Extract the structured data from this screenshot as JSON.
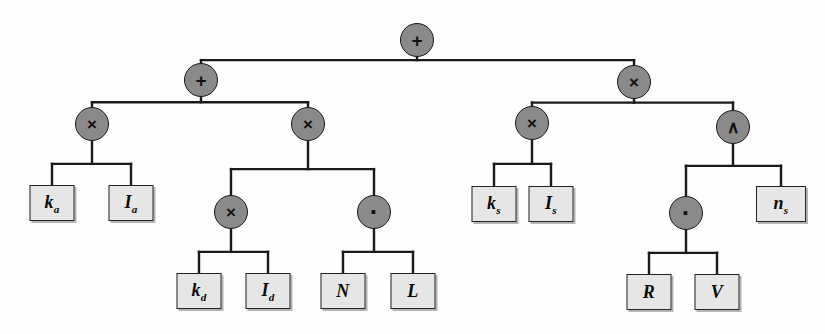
{
  "diagram": {
    "type": "binary-expression-tree",
    "background_color": "#fdfdfd",
    "node_fill": "#8a8a8a",
    "leaf_fill": "#e6e6e6",
    "edge_color": "#1a1a1a",
    "expression": "ka × Ia + kd × Id · (N · L) + ks × Is × (R · V) ^ ns"
  },
  "operators": [
    {
      "id": "root",
      "glyph": "+",
      "name": "plus",
      "x": 417,
      "y": 40,
      "r": 17,
      "font_size": 19
    },
    {
      "id": "op-left",
      "glyph": "+",
      "name": "plus",
      "x": 201,
      "y": 80,
      "r": 17,
      "font_size": 19
    },
    {
      "id": "op-ka",
      "glyph": "×",
      "name": "times",
      "x": 92,
      "y": 124,
      "r": 17,
      "font_size": 17
    },
    {
      "id": "op-diff",
      "glyph": "×",
      "name": "times",
      "x": 308,
      "y": 124,
      "r": 17,
      "font_size": 17
    },
    {
      "id": "op-kd",
      "glyph": "×",
      "name": "times",
      "x": 231,
      "y": 212,
      "r": 17,
      "font_size": 17
    },
    {
      "id": "op-dot-nl",
      "glyph": "·",
      "name": "dot-product",
      "x": 374,
      "y": 212,
      "r": 17,
      "font_size": 26
    },
    {
      "id": "op-right",
      "glyph": "×",
      "name": "times",
      "x": 634,
      "y": 82,
      "r": 17,
      "font_size": 17
    },
    {
      "id": "op-ks",
      "glyph": "×",
      "name": "times",
      "x": 532,
      "y": 123,
      "r": 17,
      "font_size": 17
    },
    {
      "id": "op-pow",
      "glyph": "∧",
      "name": "power",
      "x": 733,
      "y": 127,
      "r": 17,
      "font_size": 17
    },
    {
      "id": "op-dot-rv",
      "glyph": "·",
      "name": "dot-product",
      "x": 686,
      "y": 213,
      "r": 17,
      "font_size": 26
    }
  ],
  "leaves": [
    {
      "id": "leaf-ka",
      "base": "k",
      "sub": "a",
      "x": 52,
      "y": 203,
      "w": 45,
      "h": 36
    },
    {
      "id": "leaf-Ia",
      "base": "I",
      "sub": "a",
      "x": 131,
      "y": 203,
      "w": 45,
      "h": 36
    },
    {
      "id": "leaf-kd",
      "base": "k",
      "sub": "d",
      "x": 199,
      "y": 291,
      "w": 45,
      "h": 36
    },
    {
      "id": "leaf-Id",
      "base": "I",
      "sub": "d",
      "x": 268,
      "y": 291,
      "w": 45,
      "h": 36
    },
    {
      "id": "leaf-N",
      "base": "N",
      "sub": "",
      "x": 343,
      "y": 291,
      "w": 45,
      "h": 36
    },
    {
      "id": "leaf-L",
      "base": "L",
      "sub": "",
      "x": 413,
      "y": 291,
      "w": 45,
      "h": 36
    },
    {
      "id": "leaf-ks",
      "base": "k",
      "sub": "s",
      "x": 494,
      "y": 204,
      "w": 45,
      "h": 36
    },
    {
      "id": "leaf-Is",
      "base": "I",
      "sub": "s",
      "x": 551,
      "y": 204,
      "w": 45,
      "h": 36
    },
    {
      "id": "leaf-ns",
      "base": "n",
      "sub": "s",
      "x": 781,
      "y": 204,
      "w": 50,
      "h": 36
    },
    {
      "id": "leaf-R",
      "base": "R",
      "sub": "",
      "x": 649,
      "y": 292,
      "w": 45,
      "h": 36
    },
    {
      "id": "leaf-V",
      "base": "V",
      "sub": "",
      "x": 717,
      "y": 292,
      "w": 45,
      "h": 36
    }
  ],
  "edges": [
    {
      "from": "root",
      "to": "op-left",
      "name": "edge-root-to-left-plus"
    },
    {
      "from": "root",
      "to": "op-right",
      "name": "edge-root-to-right-times"
    },
    {
      "from": "op-left",
      "to": "op-ka",
      "name": "edge-leftplus-to-ambient-times"
    },
    {
      "from": "op-left",
      "to": "op-diff",
      "name": "edge-leftplus-to-diffuse-times"
    },
    {
      "from": "op-ka",
      "to": "leaf-ka",
      "name": "edge-ambient-to-ka"
    },
    {
      "from": "op-ka",
      "to": "leaf-Ia",
      "name": "edge-ambient-to-Ia"
    },
    {
      "from": "op-diff",
      "to": "op-kd",
      "name": "edge-diffuse-to-kd-times"
    },
    {
      "from": "op-diff",
      "to": "op-dot-nl",
      "name": "edge-diffuse-to-NL-dot"
    },
    {
      "from": "op-kd",
      "to": "leaf-kd",
      "name": "edge-kd-to-kd"
    },
    {
      "from": "op-kd",
      "to": "leaf-Id",
      "name": "edge-kd-to-Id"
    },
    {
      "from": "op-dot-nl",
      "to": "leaf-N",
      "name": "edge-dot-to-N"
    },
    {
      "from": "op-dot-nl",
      "to": "leaf-L",
      "name": "edge-dot-to-L"
    },
    {
      "from": "op-right",
      "to": "op-ks",
      "name": "edge-right-to-ks-times"
    },
    {
      "from": "op-right",
      "to": "op-pow",
      "name": "edge-right-to-power"
    },
    {
      "from": "op-ks",
      "to": "leaf-ks",
      "name": "edge-ks-to-ks"
    },
    {
      "from": "op-ks",
      "to": "leaf-Is",
      "name": "edge-ks-to-Is"
    },
    {
      "from": "op-pow",
      "to": "op-dot-rv",
      "name": "edge-power-to-RV-dot"
    },
    {
      "from": "op-pow",
      "to": "leaf-ns",
      "name": "edge-power-to-ns"
    },
    {
      "from": "op-dot-rv",
      "to": "leaf-R",
      "name": "edge-dot-to-R"
    },
    {
      "from": "op-dot-rv",
      "to": "leaf-V",
      "name": "edge-dot-to-V"
    }
  ]
}
